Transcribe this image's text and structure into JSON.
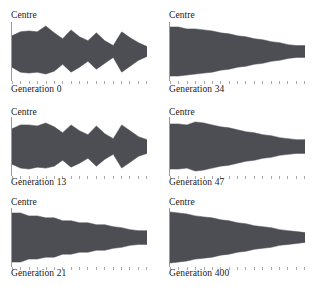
{
  "figure": {
    "axis_label": "Centre",
    "fill_color": "#4d4d54",
    "axis_color": "#9a9a9a",
    "tick_count": 17,
    "panels": [
      {
        "caption": "Generation 0",
        "axis_label": "Centre",
        "generation": 0,
        "column": "left",
        "row": 1
      },
      {
        "caption": "Generation 34",
        "axis_label": "Centre",
        "generation": 34,
        "column": "right",
        "row": 1
      },
      {
        "caption": "Generation 13",
        "axis_label": "Centre",
        "generation": 13,
        "column": "left",
        "row": 2
      },
      {
        "caption": "Generation 47",
        "axis_label": "Centre",
        "generation": 47,
        "column": "right",
        "row": 2
      },
      {
        "caption": "Generation 21",
        "axis_label": "Centre",
        "generation": 21,
        "column": "left",
        "row": 3
      },
      {
        "caption": "Generation 400",
        "axis_label": "Centre",
        "generation": 400,
        "column": "right",
        "row": 3
      }
    ]
  },
  "chart_data": [
    {
      "type": "area",
      "title": "Generation 0",
      "xlabel": "",
      "ylabel": "Centre",
      "note": "Mirrored width profile about a centre line; upper and lower half-widths per station.",
      "x": [
        0,
        1,
        2,
        3,
        4,
        5,
        6,
        7,
        8,
        9,
        10,
        11,
        12,
        13,
        14,
        15,
        16
      ],
      "series": [
        {
          "name": "upper half-width",
          "values": [
            16,
            20,
            21,
            20,
            26,
            19,
            13,
            22,
            15,
            11,
            19,
            11,
            6,
            20,
            14,
            9,
            5
          ]
        },
        {
          "name": "lower half-width",
          "values": [
            16,
            21,
            22,
            21,
            23,
            20,
            13,
            21,
            16,
            10,
            18,
            12,
            6,
            21,
            15,
            9,
            5
          ]
        }
      ],
      "ylim": [
        -28,
        28
      ],
      "grid": false,
      "legend": "none"
    },
    {
      "type": "area",
      "title": "Generation 34",
      "xlabel": "",
      "ylabel": "Centre",
      "note": "Mirrored width profile about a centre line; nearly smooth tapering wedge.",
      "x": [
        0,
        1,
        2,
        3,
        4,
        5,
        6,
        7,
        8,
        9,
        10,
        11,
        12,
        13,
        14,
        15,
        16
      ],
      "series": [
        {
          "name": "upper half-width",
          "values": [
            25,
            25,
            23,
            23,
            22,
            21,
            19,
            18,
            16,
            15,
            13,
            12,
            10,
            9,
            7,
            6,
            6
          ]
        },
        {
          "name": "lower half-width",
          "values": [
            25,
            25,
            24,
            23,
            22,
            21,
            19,
            18,
            16,
            15,
            13,
            12,
            10,
            9,
            7,
            6,
            6
          ]
        }
      ],
      "ylim": [
        -28,
        28
      ],
      "grid": false,
      "legend": "none"
    },
    {
      "type": "area",
      "title": "Generation 13",
      "xlabel": "",
      "ylabel": "Centre",
      "note": "Mirrored width profile about a centre line; jagged sawtooth profile.",
      "x": [
        0,
        1,
        2,
        3,
        4,
        5,
        6,
        7,
        8,
        9,
        10,
        11,
        12,
        13,
        14,
        15,
        16
      ],
      "series": [
        {
          "name": "upper half-width",
          "values": [
            18,
            22,
            22,
            21,
            24,
            20,
            14,
            22,
            16,
            12,
            21,
            13,
            8,
            22,
            16,
            10,
            7
          ]
        },
        {
          "name": "lower half-width",
          "values": [
            18,
            22,
            23,
            21,
            22,
            20,
            14,
            21,
            17,
            12,
            20,
            13,
            8,
            22,
            16,
            10,
            7
          ]
        }
      ],
      "ylim": [
        -28,
        28
      ],
      "grid": false,
      "legend": "none"
    },
    {
      "type": "area",
      "title": "Generation 47",
      "xlabel": "",
      "ylabel": "Centre",
      "note": "Mirrored width profile about a centre line; wedge with a small step near the root.",
      "x": [
        0,
        1,
        2,
        3,
        4,
        5,
        6,
        7,
        8,
        9,
        10,
        11,
        12,
        13,
        14,
        15,
        16
      ],
      "series": [
        {
          "name": "upper half-width",
          "values": [
            23,
            23,
            22,
            25,
            24,
            22,
            20,
            19,
            17,
            15,
            14,
            12,
            11,
            9,
            8,
            7,
            7
          ]
        },
        {
          "name": "lower half-width",
          "values": [
            23,
            23,
            22,
            25,
            24,
            22,
            20,
            19,
            17,
            15,
            14,
            12,
            11,
            9,
            8,
            7,
            7
          ]
        }
      ],
      "ylim": [
        -28,
        28
      ],
      "grid": false,
      "legend": "none"
    },
    {
      "type": "area",
      "title": "Generation 21",
      "xlabel": "",
      "ylabel": "Centre",
      "note": "Mirrored width profile about a centre line; stepped staircase taper.",
      "x": [
        0,
        1,
        2,
        3,
        4,
        5,
        6,
        7,
        8,
        9,
        10,
        11,
        12,
        13,
        14,
        15,
        16
      ],
      "series": [
        {
          "name": "upper half-width",
          "values": [
            25,
            25,
            22,
            22,
            20,
            20,
            17,
            17,
            15,
            15,
            13,
            13,
            11,
            10,
            8,
            7,
            7
          ]
        },
        {
          "name": "lower half-width",
          "values": [
            25,
            25,
            22,
            22,
            20,
            20,
            17,
            17,
            15,
            15,
            13,
            13,
            11,
            10,
            8,
            7,
            7
          ]
        }
      ],
      "ylim": [
        -28,
        28
      ],
      "grid": false,
      "legend": "none"
    },
    {
      "type": "area",
      "title": "Generation 400",
      "xlabel": "",
      "ylabel": "Centre",
      "note": "Mirrored width profile about a centre line; smooth converged wedge.",
      "x": [
        0,
        1,
        2,
        3,
        4,
        5,
        6,
        7,
        8,
        9,
        10,
        11,
        12,
        13,
        14,
        15,
        16
      ],
      "series": [
        {
          "name": "upper half-width",
          "values": [
            26,
            25,
            24,
            22,
            21,
            20,
            18,
            17,
            15,
            14,
            12,
            11,
            10,
            8,
            7,
            6,
            5
          ]
        },
        {
          "name": "lower half-width",
          "values": [
            26,
            25,
            24,
            22,
            21,
            20,
            18,
            17,
            15,
            14,
            12,
            11,
            10,
            8,
            7,
            6,
            5
          ]
        }
      ],
      "ylim": [
        -28,
        28
      ],
      "grid": false,
      "legend": "none"
    }
  ]
}
